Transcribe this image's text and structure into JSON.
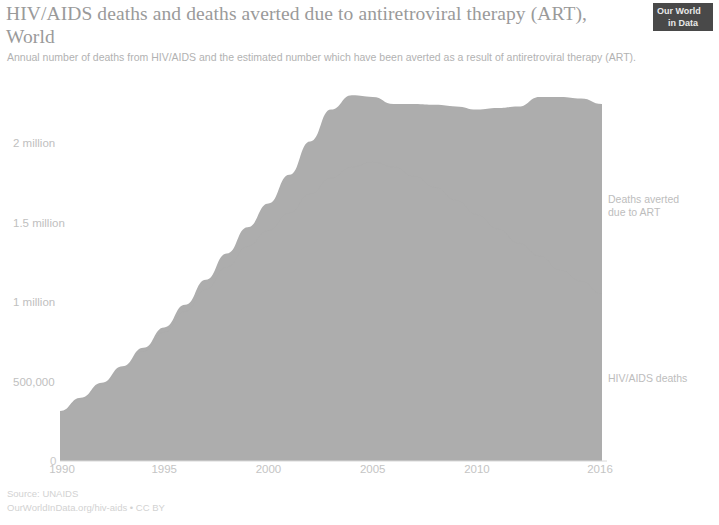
{
  "header": {
    "title": "HIV/AIDS deaths and deaths averted due to antiretroviral therapy (ART), World",
    "subtitle": "Annual number of deaths from HIV/AIDS and the estimated number which have been averted as a result of antiretroviral therapy (ART)."
  },
  "logo": {
    "line1": "Our World",
    "line2": "in Data"
  },
  "footer": {
    "source": "Source: UNAIDS",
    "attribution": "OurWorldInData.org/hiv-aids • CC BY"
  },
  "chart_data": {
    "type": "area",
    "title": "HIV/AIDS deaths and deaths averted due to antiretroviral therapy (ART), World",
    "subtitle": "Annual number of deaths from HIV/AIDS and the estimated number which have been averted as a result of antiretroviral therapy (ART).",
    "stacked": true,
    "xlabel": "",
    "ylabel": "",
    "xlim": [
      1990,
      2016
    ],
    "ylim": [
      0,
      2400000
    ],
    "grid": false,
    "legend_position": "right-inline",
    "fill_color": "#adadad",
    "x": [
      1990,
      1991,
      1992,
      1993,
      1994,
      1995,
      1996,
      1997,
      1998,
      1999,
      2000,
      2001,
      2002,
      2003,
      2004,
      2005,
      2006,
      2007,
      2008,
      2009,
      2010,
      2011,
      2012,
      2013,
      2014,
      2015,
      2016
    ],
    "x_tick_labels": [
      "1990",
      "1995",
      "2000",
      "2005",
      "2010",
      "2016"
    ],
    "x_tick_values": [
      1990,
      1995,
      2000,
      2005,
      2010,
      2016
    ],
    "y_tick_labels": [
      "0",
      "500,000",
      "1 million",
      "1.5 million",
      "2 million"
    ],
    "y_tick_values": [
      0,
      500000,
      1000000,
      1500000,
      2000000
    ],
    "series": [
      {
        "name": "HIV/AIDS deaths",
        "label": "HIV/AIDS deaths",
        "color": "#adadad",
        "values": [
          310000,
          390000,
          480000,
          580000,
          690000,
          810000,
          940000,
          1080000,
          1220000,
          1350000,
          1450000,
          1560000,
          1680000,
          1780000,
          1850000,
          1880000,
          1850000,
          1790000,
          1720000,
          1640000,
          1550000,
          1460000,
          1370000,
          1290000,
          1200000,
          1130000,
          1050000
        ]
      },
      {
        "name": "Deaths averted due to ART",
        "label": "Deaths averted\ndue to ART",
        "color": "#adadad",
        "values": [
          5000,
          8000,
          12000,
          16000,
          22000,
          30000,
          42000,
          60000,
          85000,
          120000,
          170000,
          240000,
          330000,
          430000,
          450000,
          410000,
          395000,
          455000,
          520000,
          590000,
          660000,
          760000,
          860000,
          1000000,
          1090000,
          1150000,
          1195000
        ]
      }
    ],
    "totals": [
      315000,
      398000,
      492000,
      596000,
      712000,
      840000,
      982000,
      1140000,
      1305000,
      1470000,
      1620000,
      1800000,
      2010000,
      2210000,
      2300000,
      2290000,
      2245000,
      2245000,
      2240000,
      2230000,
      2210000,
      2220000,
      2230000,
      2290000,
      2290000,
      2280000,
      2245000
    ]
  }
}
